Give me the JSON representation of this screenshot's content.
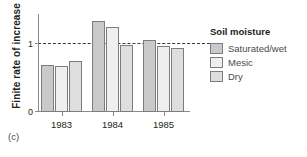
{
  "panel_label": "(c)",
  "axis": {
    "y_title": "Finite rate of increase",
    "y_ticks": [
      "0",
      "1"
    ]
  },
  "legend": {
    "title": "Soil moisture",
    "items": [
      {
        "label": "Saturated/wet",
        "color": "#c9c9c9"
      },
      {
        "label": "Mesic",
        "color": "#efefef"
      },
      {
        "label": "Dry",
        "color": "#dedede"
      }
    ]
  },
  "chart_data": {
    "type": "bar",
    "title": "",
    "subtitle": "",
    "xlabel": "",
    "ylabel": "Finite rate of increase",
    "categories": [
      "1983",
      "1984",
      "1985"
    ],
    "series": [
      {
        "name": "Saturated/wet",
        "color": "#c9c9c9",
        "values": [
          0.7,
          1.35,
          1.07
        ]
      },
      {
        "name": "Mesic",
        "color": "#efefef",
        "values": [
          0.68,
          1.26,
          0.97
        ]
      },
      {
        "name": "Dry",
        "color": "#dedede",
        "values": [
          0.76,
          0.99,
          0.95
        ]
      }
    ],
    "ylim": [
      0,
      1.45
    ],
    "yticks": [
      0,
      1
    ],
    "ytick_labels": [
      "0",
      "1"
    ],
    "reference_line": {
      "value": 1,
      "style": "dashed",
      "color": "#3b3b3b"
    },
    "grid": false,
    "legend_position": "right",
    "panel_label": "(c)"
  }
}
